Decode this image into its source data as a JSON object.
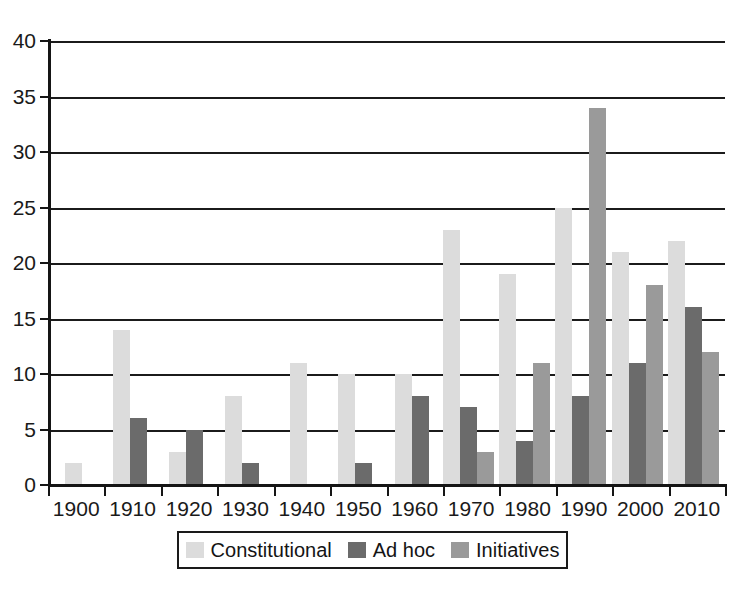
{
  "chart_data": {
    "type": "bar",
    "title": "",
    "subtitle": "",
    "xlabel": "",
    "ylabel": "",
    "categories": [
      "1900",
      "1910",
      "1920",
      "1930",
      "1940",
      "1950",
      "1960",
      "1970",
      "1980",
      "1990",
      "2000",
      "2010"
    ],
    "series": [
      {
        "name": "Constitutional",
        "color": "#dcdcdc",
        "values": [
          2,
          14,
          3,
          8,
          11,
          10,
          10,
          23,
          19,
          25,
          21,
          22
        ]
      },
      {
        "name": "Ad hoc",
        "color": "#6b6b6b",
        "values": [
          0,
          6,
          5,
          2,
          0,
          2,
          8,
          7,
          4,
          8,
          11,
          16
        ]
      },
      {
        "name": "Initiatives",
        "color": "#9a9a9a",
        "values": [
          0,
          0,
          0,
          0,
          0,
          0,
          0,
          3,
          11,
          34,
          18,
          12
        ]
      }
    ],
    "ylim": [
      0,
      40
    ],
    "ytick_values": [
      0,
      5,
      10,
      15,
      20,
      25,
      30,
      35,
      40
    ],
    "ytick_labels": [
      "0",
      "5",
      "10",
      "15",
      "20",
      "25",
      "30",
      "35",
      "40"
    ],
    "grid": true,
    "grid_axis": "y",
    "legend_position": "bottom",
    "bar_mode": "grouped"
  },
  "legend": {
    "entries": [
      {
        "label": "Constitutional",
        "swatch": "legend-swatch-constitutional"
      },
      {
        "label": "Ad hoc",
        "swatch": "legend-swatch-ad-hoc"
      },
      {
        "label": "Initiatives",
        "swatch": "legend-swatch-initiatives"
      }
    ]
  }
}
